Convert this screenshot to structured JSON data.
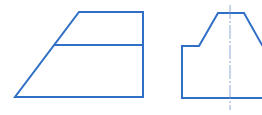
{
  "drawing": {
    "type": "orthographic-views",
    "stroke_color": "#2f6fc6",
    "centerline_color": "#6f95c9",
    "background": "#ffffff",
    "views": [
      {
        "name": "front-view",
        "outline": [
          [
            79,
            12
          ],
          [
            143,
            12
          ],
          [
            143,
            97
          ],
          [
            15,
            97
          ]
        ],
        "lines": [
          [
            [
              55,
              45
            ],
            [
              143,
              45
            ]
          ]
        ]
      },
      {
        "name": "side-view",
        "outline": [
          [
            182,
            98
          ],
          [
            182,
            46
          ],
          [
            199,
            46
          ],
          [
            218,
            13
          ],
          [
            244,
            13
          ],
          [
            262,
            45
          ]
        ],
        "bottom": [
          [
            182,
            98
          ],
          [
            262,
            98
          ]
        ],
        "centerline": [
          [
            230,
            5
          ],
          [
            230,
            110
          ]
        ]
      }
    ]
  }
}
